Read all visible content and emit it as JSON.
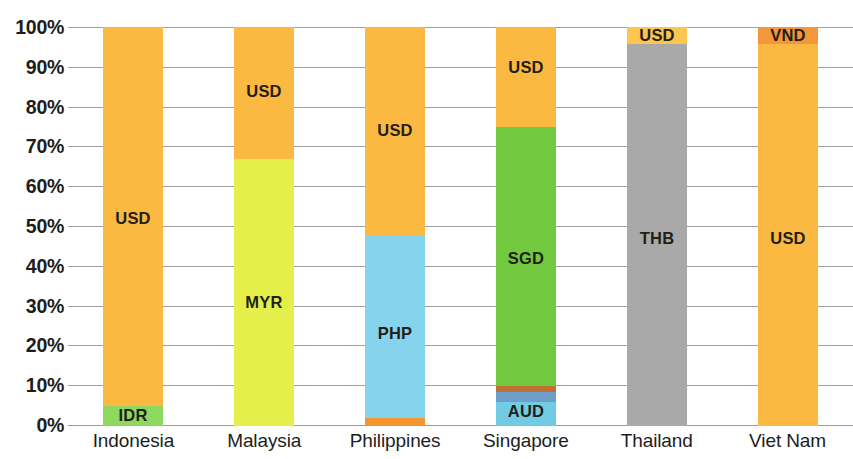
{
  "chart_data": {
    "type": "bar",
    "subtype": "stacked-bar-100-percent",
    "title": "",
    "xlabel": "",
    "ylabel": "",
    "ylim": [
      0,
      100
    ],
    "y_unit": "%",
    "grid": true,
    "legend": "none (segments labelled in place)",
    "y_tick_labels": [
      "100%",
      "90%",
      "80%",
      "70%",
      "60%",
      "50%",
      "40%",
      "30%",
      "20%",
      "10%",
      "0%"
    ],
    "y_tick_values": [
      100,
      90,
      80,
      70,
      60,
      50,
      40,
      30,
      20,
      10,
      0
    ],
    "categories": [
      "Indonesia",
      "Malaysia",
      "Philippines",
      "Singapore",
      "Thailand",
      "Viet Nam"
    ],
    "bars": [
      {
        "category": "Indonesia",
        "segments": [
          {
            "label": "IDR",
            "value": 5,
            "start": 0,
            "end": 5,
            "color": "#8ed860",
            "show_label": true
          },
          {
            "label": "USD",
            "value": 95,
            "start": 5,
            "end": 100,
            "color": "#fbb942",
            "show_label": true
          }
        ]
      },
      {
        "category": "Malaysia",
        "segments": [
          {
            "label": "MYR",
            "value": 67,
            "start": 0,
            "end": 67,
            "color": "#e4ef4a",
            "show_label": true
          },
          {
            "label": "USD",
            "value": 33,
            "start": 67,
            "end": 100,
            "color": "#fbb942",
            "show_label": true
          }
        ]
      },
      {
        "category": "Philippines",
        "segments": [
          {
            "label": "",
            "value": 2,
            "start": 0,
            "end": 2,
            "color": "#f6972e",
            "show_label": false
          },
          {
            "label": "PHP",
            "value": 46,
            "start": 2,
            "end": 48,
            "color": "#86d3ee",
            "show_label": true
          },
          {
            "label": "USD",
            "value": 52,
            "start": 48,
            "end": 100,
            "color": "#fbb942",
            "show_label": true
          }
        ]
      },
      {
        "category": "Singapore",
        "segments": [
          {
            "label": "AUD",
            "value": 6,
            "start": 0,
            "end": 6,
            "color": "#72cbe4",
            "show_label": true
          },
          {
            "label": "",
            "value": 2.5,
            "start": 6,
            "end": 8.5,
            "color": "#6f9fc8",
            "show_label": false
          },
          {
            "label": "",
            "value": 1.5,
            "start": 8.5,
            "end": 10,
            "color": "#bf7033",
            "show_label": false
          },
          {
            "label": "SGD",
            "value": 65,
            "start": 10,
            "end": 75,
            "color": "#72c93f",
            "show_label": true
          },
          {
            "label": "USD",
            "value": 25,
            "start": 75,
            "end": 100,
            "color": "#fbb942",
            "show_label": true
          }
        ]
      },
      {
        "category": "Thailand",
        "segments": [
          {
            "label": "THB",
            "value": 96,
            "start": 0,
            "end": 96,
            "color": "#a9a9a9",
            "show_label": true
          },
          {
            "label": "USD",
            "value": 4,
            "start": 96,
            "end": 100,
            "color": "#fbc54e",
            "show_label": true
          }
        ]
      },
      {
        "category": "Viet Nam",
        "segments": [
          {
            "label": "USD",
            "value": 96,
            "start": 0,
            "end": 96,
            "color": "#fbb942",
            "show_label": true
          },
          {
            "label": "VND",
            "value": 4,
            "start": 96,
            "end": 100,
            "color": "#f5963a",
            "show_label": true
          }
        ]
      }
    ],
    "label_vertical_positions": {
      "Indonesia": {
        "USD": 52
      },
      "Malaysia": {
        "USD": 84,
        "MYR": 31
      },
      "Philippines": {
        "USD": 74,
        "PHP": 23
      },
      "Singapore": {
        "USD": 90,
        "SGD": 42,
        "AUD": 3.5
      },
      "Thailand": {
        "THB": 47,
        "USD": 98
      },
      "Viet Nam": {
        "USD": 47,
        "VND": 98
      }
    },
    "colors": {
      "usd": "#fbb942",
      "idr": "#8ed860",
      "myr": "#e4ef4a",
      "php": "#86d3ee",
      "sgd": "#72c93f",
      "aud": "#72cbe4",
      "thb": "#a9a9a9",
      "vnd": "#f5963a",
      "gridline": "#8e8e8e",
      "text": "#1d1d1d"
    }
  }
}
